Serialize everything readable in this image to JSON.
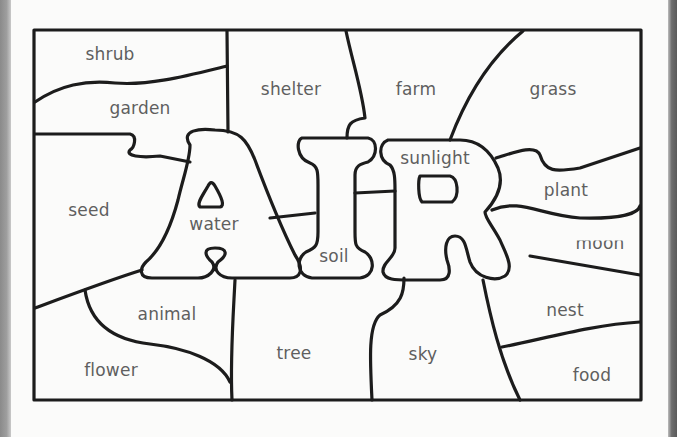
{
  "page": {
    "title_word": "AIR",
    "colors": {
      "outline": "#1c1c1c",
      "label": "#5f5f5f",
      "paper": "#fbfbfa",
      "edge": "#8a8a8a"
    }
  },
  "regions": [
    {
      "id": "shrub",
      "label": "shrub",
      "x": 110,
      "y": 54
    },
    {
      "id": "garden",
      "label": "garden",
      "x": 140,
      "y": 108
    },
    {
      "id": "shelter",
      "label": "shelter",
      "x": 291,
      "y": 89
    },
    {
      "id": "farm",
      "label": "farm",
      "x": 416,
      "y": 89
    },
    {
      "id": "grass",
      "label": "grass",
      "x": 553,
      "y": 89
    },
    {
      "id": "seed",
      "label": "seed",
      "x": 89,
      "y": 210
    },
    {
      "id": "water",
      "label": "water",
      "x": 214,
      "y": 224
    },
    {
      "id": "sunlight",
      "label": "sunlight",
      "x": 435,
      "y": 158
    },
    {
      "id": "plant",
      "label": "plant",
      "x": 566,
      "y": 190
    },
    {
      "id": "soil",
      "label": "soil",
      "x": 334,
      "y": 256
    },
    {
      "id": "moon",
      "label": "moon",
      "x": 600,
      "y": 243
    },
    {
      "id": "animal",
      "label": "animal",
      "x": 167,
      "y": 314
    },
    {
      "id": "nest",
      "label": "nest",
      "x": 565,
      "y": 310
    },
    {
      "id": "tree",
      "label": "tree",
      "x": 294,
      "y": 353
    },
    {
      "id": "sky",
      "label": "sky",
      "x": 423,
      "y": 354
    },
    {
      "id": "flower",
      "label": "flower",
      "x": 111,
      "y": 370
    },
    {
      "id": "food",
      "label": "food",
      "x": 592,
      "y": 375
    }
  ]
}
